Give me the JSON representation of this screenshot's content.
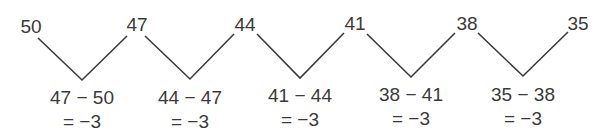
{
  "sequence": {
    "terms": [
      "50",
      "47",
      "44",
      "41",
      "38",
      "35"
    ]
  },
  "differences": [
    {
      "expr": "47 − 50",
      "result": "= −3"
    },
    {
      "expr": "44 − 47",
      "result": "= −3"
    },
    {
      "expr": "41 − 44",
      "result": "= −3"
    },
    {
      "expr": "38 − 41",
      "result": "= −3"
    },
    {
      "expr": "35 − 38",
      "result": "= −3"
    }
  ],
  "colors": {
    "line": "#3a3a3a",
    "text": "#3a3a3a",
    "background": "#ffffff"
  }
}
